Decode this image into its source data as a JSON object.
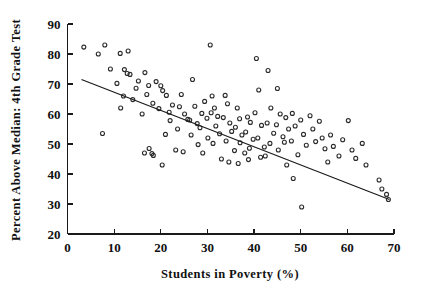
{
  "chart_data": {
    "type": "scatter",
    "title": "",
    "xlabel": "Students in Poverty (%)",
    "ylabel": "Percent Above Median: 4th Grade Test",
    "xlim": [
      0,
      70
    ],
    "ylim": [
      20,
      90
    ],
    "xticks": [
      0,
      10,
      20,
      30,
      40,
      50,
      60,
      70
    ],
    "yticks": [
      20,
      30,
      40,
      50,
      60,
      70,
      80,
      90
    ],
    "xtick_labels": [
      "0",
      "10",
      "20",
      "30",
      "40",
      "50",
      "60",
      "70"
    ],
    "ytick_labels": [
      "20",
      "30",
      "40",
      "50",
      "60",
      "70",
      "80",
      "90"
    ],
    "grid": false,
    "legend": null,
    "marker": "open-circle",
    "point_color": "#2a2a2a",
    "line_color": "#1a1a1a",
    "background_color": "#ffffff",
    "trendline": {
      "type": "linear-regression",
      "x_start": 3.0,
      "y_start": 71.5,
      "x_end": 69.0,
      "y_end": 31.5
    },
    "points": [
      [
        3.5,
        82.3
      ],
      [
        6.6,
        80.0
      ],
      [
        8.0,
        83.0
      ],
      [
        9.2,
        75.0
      ],
      [
        7.5,
        53.5
      ],
      [
        11.3,
        80.2
      ],
      [
        13.0,
        81.0
      ],
      [
        10.6,
        70.2
      ],
      [
        12.2,
        74.8
      ],
      [
        12.8,
        73.5
      ],
      [
        13.4,
        73.2
      ],
      [
        14.7,
        68.6
      ],
      [
        12.0,
        66.0
      ],
      [
        14.0,
        64.8
      ],
      [
        11.4,
        62.0
      ],
      [
        15.2,
        71.0
      ],
      [
        16.6,
        73.8
      ],
      [
        16.0,
        60.0
      ],
      [
        17.4,
        69.5
      ],
      [
        17.0,
        66.5
      ],
      [
        18.3,
        63.6
      ],
      [
        16.5,
        47.0
      ],
      [
        17.5,
        48.5
      ],
      [
        18.4,
        46.2
      ],
      [
        18.1,
        46.8
      ],
      [
        20.3,
        43.0
      ],
      [
        19.0,
        70.8
      ],
      [
        20.0,
        69.4
      ],
      [
        20.4,
        67.8
      ],
      [
        21.2,
        66.2
      ],
      [
        19.6,
        61.8
      ],
      [
        21.8,
        60.6
      ],
      [
        22.5,
        63.0
      ],
      [
        22.0,
        57.8
      ],
      [
        23.6,
        55.0
      ],
      [
        21.0,
        53.2
      ],
      [
        24.4,
        66.5
      ],
      [
        24.0,
        62.4
      ],
      [
        25.1,
        60.0
      ],
      [
        25.8,
        58.2
      ],
      [
        23.2,
        48.0
      ],
      [
        24.8,
        47.4
      ],
      [
        26.8,
        71.5
      ],
      [
        27.3,
        62.6
      ],
      [
        26.2,
        58.0
      ],
      [
        27.8,
        56.8
      ],
      [
        26.5,
        53.0
      ],
      [
        28.0,
        49.8
      ],
      [
        29.4,
        64.2
      ],
      [
        28.8,
        60.2
      ],
      [
        29.9,
        58.6
      ],
      [
        28.4,
        55.4
      ],
      [
        30.1,
        52.0
      ],
      [
        29.0,
        47.0
      ],
      [
        30.6,
        83.0
      ],
      [
        31.0,
        66.0
      ],
      [
        31.5,
        62.0
      ],
      [
        30.8,
        60.4
      ],
      [
        32.2,
        59.2
      ],
      [
        31.8,
        56.0
      ],
      [
        32.6,
        53.4
      ],
      [
        31.2,
        50.2
      ],
      [
        33.0,
        45.0
      ],
      [
        33.8,
        66.2
      ],
      [
        34.3,
        63.4
      ],
      [
        33.4,
        58.8
      ],
      [
        34.8,
        57.0
      ],
      [
        35.2,
        54.2
      ],
      [
        34.0,
        51.0
      ],
      [
        35.8,
        47.8
      ],
      [
        34.6,
        44.0
      ],
      [
        36.4,
        62.0
      ],
      [
        36.9,
        58.4
      ],
      [
        36.0,
        55.6
      ],
      [
        37.4,
        53.0
      ],
      [
        37.0,
        50.4
      ],
      [
        38.0,
        47.0
      ],
      [
        36.6,
        43.5
      ],
      [
        38.6,
        59.0
      ],
      [
        39.2,
        57.2
      ],
      [
        38.2,
        54.0
      ],
      [
        39.8,
        51.6
      ],
      [
        39.0,
        48.6
      ],
      [
        38.8,
        44.8
      ],
      [
        40.5,
        78.5
      ],
      [
        41.0,
        68.0
      ],
      [
        40.2,
        60.4
      ],
      [
        41.6,
        56.2
      ],
      [
        40.8,
        52.0
      ],
      [
        42.2,
        49.0
      ],
      [
        41.4,
        45.6
      ],
      [
        43.0,
        74.5
      ],
      [
        43.6,
        62.0
      ],
      [
        42.8,
        57.0
      ],
      [
        44.2,
        53.6
      ],
      [
        43.4,
        50.2
      ],
      [
        42.4,
        46.0
      ],
      [
        45.0,
        68.5
      ],
      [
        45.6,
        60.0
      ],
      [
        44.8,
        56.4
      ],
      [
        46.2,
        52.4
      ],
      [
        45.2,
        48.0
      ],
      [
        46.8,
        58.8
      ],
      [
        47.4,
        55.0
      ],
      [
        46.5,
        50.6
      ],
      [
        47.0,
        43.0
      ],
      [
        48.2,
        60.2
      ],
      [
        48.8,
        56.0
      ],
      [
        48.0,
        51.0
      ],
      [
        49.4,
        46.4
      ],
      [
        48.4,
        38.5
      ],
      [
        50.0,
        58.0
      ],
      [
        50.6,
        53.2
      ],
      [
        51.2,
        49.6
      ],
      [
        50.2,
        29.0
      ],
      [
        52.0,
        59.4
      ],
      [
        52.6,
        55.0
      ],
      [
        53.2,
        50.8
      ],
      [
        54.0,
        57.6
      ],
      [
        54.6,
        52.0
      ],
      [
        55.2,
        48.4
      ],
      [
        55.8,
        44.0
      ],
      [
        56.4,
        53.0
      ],
      [
        57.0,
        49.2
      ],
      [
        58.2,
        46.0
      ],
      [
        59.0,
        51.4
      ],
      [
        60.2,
        57.8
      ],
      [
        61.0,
        48.0
      ],
      [
        61.8,
        45.2
      ],
      [
        63.2,
        50.2
      ],
      [
        64.0,
        43.0
      ],
      [
        66.8,
        38.0
      ],
      [
        67.4,
        35.0
      ],
      [
        68.4,
        33.2
      ],
      [
        68.8,
        31.5
      ]
    ]
  }
}
